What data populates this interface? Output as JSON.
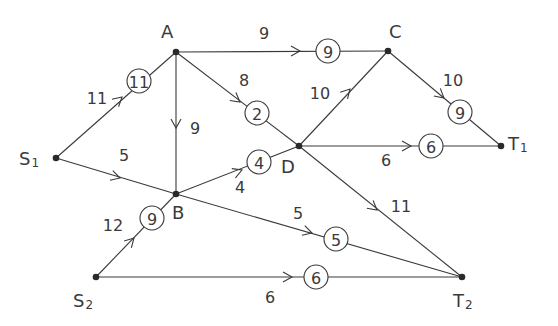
{
  "diagram": {
    "type": "flow-network",
    "colors": {
      "line": "#3a3a3a",
      "node": "#2a2a2a",
      "background": "#ffffff"
    },
    "nodes": [
      {
        "id": "S1",
        "label": "S",
        "sub": "1",
        "x": 56,
        "y": 158,
        "lx": 26,
        "ly": 158
      },
      {
        "id": "S2",
        "label": "S",
        "sub": "2",
        "x": 96,
        "y": 277,
        "lx": 80,
        "ly": 300
      },
      {
        "id": "A",
        "label": "A",
        "sub": "",
        "x": 176,
        "y": 52,
        "lx": 168,
        "ly": 31
      },
      {
        "id": "B",
        "label": "B",
        "sub": "",
        "x": 176,
        "y": 194,
        "lx": 179,
        "ly": 212
      },
      {
        "id": "C",
        "label": "C",
        "sub": "",
        "x": 388,
        "y": 51,
        "lx": 396,
        "ly": 31
      },
      {
        "id": "D",
        "label": "D",
        "sub": "",
        "x": 299,
        "y": 146,
        "lx": 288,
        "ly": 166
      },
      {
        "id": "T1",
        "label": "T",
        "sub": "1",
        "x": 501,
        "y": 146,
        "lx": 515,
        "ly": 143
      },
      {
        "id": "T2",
        "label": "T",
        "sub": "2",
        "x": 462,
        "y": 277,
        "lx": 460,
        "ly": 300
      }
    ],
    "edges": [
      {
        "from": "S1",
        "to": "A",
        "capacity": "11",
        "flow": "11",
        "cx": 139,
        "cy": 81,
        "capx": 97,
        "capy": 98,
        "ax": 122,
        "ay": 97
      },
      {
        "from": "S1",
        "to": "B",
        "capacity": "5",
        "flow": "",
        "cx": null,
        "cy": null,
        "capx": 124,
        "capy": 155,
        "ax": 120,
        "ay": 178
      },
      {
        "from": "A",
        "to": "B",
        "capacity": "9",
        "flow": "",
        "cx": null,
        "cy": null,
        "capx": 195,
        "capy": 128,
        "ax": 176,
        "ay": 128
      },
      {
        "from": "A",
        "to": "C",
        "capacity": "9",
        "flow": "9",
        "cx": 328,
        "cy": 51,
        "capx": 264,
        "capy": 33,
        "ax": 300,
        "ay": 51
      },
      {
        "from": "A",
        "to": "D",
        "capacity": "8",
        "flow": "2",
        "cx": 257,
        "cy": 113,
        "capx": 244,
        "capy": 80,
        "ax": 240,
        "ay": 102
      },
      {
        "from": "B",
        "to": "D",
        "capacity": "4",
        "flow": "4",
        "cx": 259,
        "cy": 162,
        "capx": 240,
        "capy": 187,
        "ax": 242,
        "ay": 170
      },
      {
        "from": "D",
        "to": "C",
        "capacity": "10",
        "flow": "",
        "cx": null,
        "cy": null,
        "capx": 320,
        "capy": 93,
        "ax": 350,
        "ay": 89
      },
      {
        "from": "C",
        "to": "T1",
        "capacity": "10",
        "flow": "9",
        "cx": 460,
        "cy": 112,
        "capx": 453,
        "capy": 80,
        "ax": 444,
        "ay": 98
      },
      {
        "from": "D",
        "to": "T1",
        "capacity": "6",
        "flow": "6",
        "cx": 431,
        "cy": 146,
        "capx": 386,
        "capy": 160,
        "ax": 411,
        "ay": 146
      },
      {
        "from": "D",
        "to": "T2",
        "capacity": "11",
        "flow": "",
        "cx": null,
        "cy": null,
        "capx": 401,
        "capy": 206,
        "ax": 377,
        "ay": 210
      },
      {
        "from": "B",
        "to": "T2",
        "capacity": "5",
        "flow": "5",
        "cx": 336,
        "cy": 239,
        "capx": 298,
        "capy": 213,
        "ax": 312,
        "ay": 233
      },
      {
        "from": "S2",
        "to": "B",
        "capacity": "12",
        "flow": "9",
        "cx": 152,
        "cy": 218,
        "capx": 113,
        "capy": 225,
        "ax": 134,
        "ay": 238
      },
      {
        "from": "S2",
        "to": "T2",
        "capacity": "6",
        "flow": "6",
        "cx": 316,
        "cy": 277,
        "capx": 270,
        "capy": 297,
        "ax": 292,
        "ay": 277
      }
    ]
  }
}
